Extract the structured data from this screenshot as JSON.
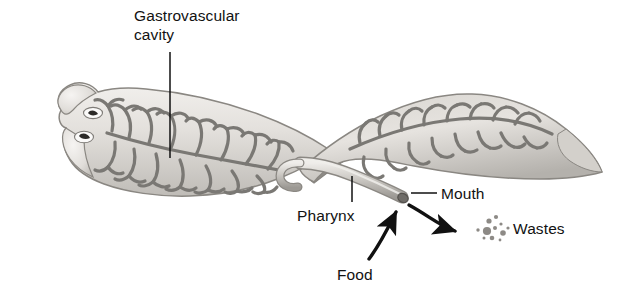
{
  "figure": {
    "organism": "planarian flatworm",
    "background_color": "#ffffff",
    "body_fill_light": "#e9e7e3",
    "body_fill_mid": "#cfccc7",
    "body_fill_dark": "#a9a6a1",
    "cavity_color": "#7d7b77",
    "outline_color": "#8d8a86",
    "ink_color": "#121212"
  },
  "labels": {
    "gastrovascular_cavity": {
      "line1": "Gastrovascular",
      "line2": "cavity"
    },
    "pharynx": "Pharynx",
    "mouth": "Mouth",
    "food": "Food",
    "wastes": "Wastes"
  },
  "annotations": {
    "leader_gastrovascular": "vertical line from label down into branched cavity",
    "leader_pharynx": "vertical line from label up to pharynx tube",
    "leader_mouth": "horizontal line from label left to mouth opening",
    "arrow_food": "curved arrow pointing up into the mouth",
    "arrow_wastes": "curved arrow pointing right away from the mouth toward waste particles"
  },
  "structures": {
    "eyespots": 2,
    "auricles": 2,
    "waste_particles": 11
  }
}
